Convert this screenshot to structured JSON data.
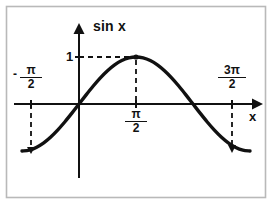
{
  "figure": {
    "kind": "math-plot",
    "background": "#ffffff",
    "frame_color": "#b9b9b9",
    "ink_color": "#111111"
  },
  "labels": {
    "y_axis_title": "sin x",
    "x_axis_title": "x",
    "y_tick_one": "1",
    "neg_pi_over_2": {
      "sign": "-",
      "numerator": "π",
      "denominator": "2"
    },
    "pi_over_2": {
      "numerator": "π",
      "denominator": "2"
    },
    "three_pi_over_2": {
      "numerator": "3π",
      "denominator": "2"
    }
  },
  "chart_data": {
    "type": "line",
    "title": "sin x",
    "xlabel": "x",
    "ylabel": "sin x",
    "function": "y = sin(x)",
    "xlim": [
      -1.5707963,
      4.712389
    ],
    "ylim": [
      -1,
      1
    ],
    "grid": false,
    "legend": null,
    "x_ticks": [
      {
        "value": -1.5707963,
        "label": "-π/2"
      },
      {
        "value": 1.5707963,
        "label": "π/2"
      },
      {
        "value": 4.712389,
        "label": "3π/2"
      }
    ],
    "y_ticks": [
      {
        "value": 1,
        "label": "1"
      }
    ],
    "annotations": [
      {
        "kind": "point-marker",
        "x": 1.5707963,
        "y": 1,
        "label": "maximum"
      },
      {
        "kind": "dashed-guide",
        "from": [
          0,
          1
        ],
        "to": [
          1.5707963,
          1
        ],
        "orientation": "horizontal"
      },
      {
        "kind": "dashed-guide",
        "from": [
          1.5707963,
          1
        ],
        "to": [
          1.5707963,
          0
        ],
        "orientation": "vertical"
      },
      {
        "kind": "dashed-guide",
        "from": [
          -1.5707963,
          0
        ],
        "to": [
          -1.5707963,
          -1
        ],
        "orientation": "vertical"
      },
      {
        "kind": "dashed-guide",
        "from": [
          4.712389,
          0
        ],
        "to": [
          4.712389,
          -1
        ],
        "orientation": "vertical"
      }
    ],
    "series": [
      {
        "name": "sin x",
        "color": "#111111",
        "x": [
          -1.5707963,
          -1.3744468,
          -1.1780972,
          -0.9817477,
          -0.7853982,
          -0.5890486,
          -0.3926991,
          -0.1963495,
          0,
          0.1963495,
          0.3926991,
          0.5890486,
          0.7853982,
          0.9817477,
          1.1780972,
          1.3744468,
          1.5707963,
          1.7671459,
          1.9634954,
          2.1598449,
          2.3561945,
          2.552544,
          2.7488936,
          2.9452431,
          3.1415927,
          3.3379422,
          3.5342917,
          3.7306413,
          3.9269908,
          4.1233404,
          4.3196899,
          4.5160394,
          4.712389
        ],
        "y": [
          -1,
          -0.98079,
          -0.92388,
          -0.83147,
          -0.70711,
          -0.55557,
          -0.38268,
          -0.19509,
          0,
          0.19509,
          0.38268,
          0.55557,
          0.70711,
          0.83147,
          0.92388,
          0.98079,
          1,
          0.98079,
          0.92388,
          0.83147,
          0.70711,
          0.55557,
          0.38268,
          0.19509,
          0,
          -0.19509,
          -0.38268,
          -0.55557,
          -0.70711,
          -0.83147,
          -0.92388,
          -0.98079,
          -1
        ]
      }
    ]
  }
}
